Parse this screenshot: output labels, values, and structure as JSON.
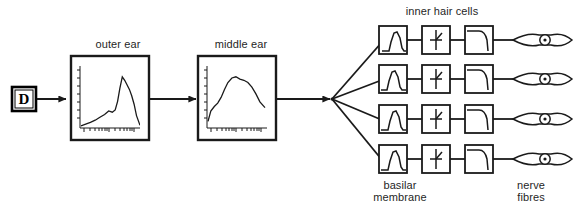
{
  "figure": {
    "background_color": "#ffffff",
    "line_color": "#1a1a1a",
    "text_color": "#1f1f1f",
    "width": 586,
    "height": 213
  },
  "source": {
    "label": "D",
    "name": "signal-source-block"
  },
  "stages": {
    "outer_ear": {
      "label": "outer ear",
      "plot": {
        "type": "line",
        "xlabel": "",
        "ylabel": "",
        "description": "outer ear transfer function, gain vs log frequency",
        "x": [
          0.0,
          0.08,
          0.16,
          0.24,
          0.32,
          0.4,
          0.47,
          0.53,
          0.58,
          0.62,
          0.66,
          0.7,
          0.74,
          0.78,
          0.82,
          0.86,
          0.9,
          0.94,
          1.0
        ],
        "y": [
          0.02,
          0.05,
          0.08,
          0.12,
          0.17,
          0.22,
          0.28,
          0.26,
          0.3,
          0.45,
          0.68,
          0.88,
          0.82,
          0.74,
          0.66,
          0.55,
          0.4,
          0.2,
          0.03
        ],
        "xlim": [
          0,
          1
        ],
        "ylim": [
          0,
          1
        ],
        "grid": false,
        "n_y_ticks": 7,
        "n_x_ticks": 16
      }
    },
    "middle_ear": {
      "label": "middle ear",
      "plot": {
        "type": "line",
        "xlabel": "",
        "ylabel": "",
        "description": "middle ear transfer function, gain vs log frequency",
        "x": [
          0.0,
          0.05,
          0.11,
          0.17,
          0.23,
          0.29,
          0.35,
          0.42,
          0.49,
          0.56,
          0.63,
          0.7,
          0.77,
          0.84,
          0.91,
          1.0
        ],
        "y": [
          0.1,
          0.28,
          0.36,
          0.42,
          0.52,
          0.66,
          0.78,
          0.86,
          0.88,
          0.84,
          0.82,
          0.78,
          0.7,
          0.58,
          0.44,
          0.34
        ],
        "xlim": [
          0,
          1
        ],
        "ylim": [
          0,
          1
        ],
        "grid": false,
        "n_y_ticks": 7,
        "n_x_ticks": 18
      }
    }
  },
  "channels": {
    "count": 4,
    "column_labels": {
      "basilar_membrane": "basilar\nmembrane",
      "basilar_membrane_line1": "basilar",
      "basilar_membrane_line2": "membrane",
      "inner_hair_cells": "inner hair cells",
      "nerve_fibres": "nerve\nfibres",
      "nerve_fibres_line1": "nerve",
      "nerve_fibres_line2": "fibres"
    },
    "blocks": [
      {
        "name": "bandpass-filter",
        "icon": "resonance-curve-icon",
        "stage": "basilar membrane"
      },
      {
        "name": "half-wave-rectifier",
        "icon": "rectifier-icon",
        "stage": "inner hair cells"
      },
      {
        "name": "lowpass-filter",
        "icon": "lowpass-curve-icon",
        "stage": "inner hair cells"
      },
      {
        "name": "nerve-fibre",
        "icon": "neuron-icon",
        "stage": "nerve fibres"
      }
    ],
    "rows": [
      {
        "index": 1,
        "bandpass_peak_position": 0.62
      },
      {
        "index": 2,
        "bandpass_peak_position": 0.5
      },
      {
        "index": 3,
        "bandpass_peak_position": 0.52
      },
      {
        "index": 4,
        "bandpass_peak_position": 0.58
      }
    ]
  },
  "connections": [
    {
      "from": "signal-source-block",
      "to": "outer-ear-block",
      "style": "arrow"
    },
    {
      "from": "outer-ear-block",
      "to": "middle-ear-block",
      "style": "arrow"
    },
    {
      "from": "middle-ear-block",
      "to": "fan-out-junction",
      "style": "arrow"
    },
    {
      "from": "fan-out-junction",
      "to": "channel-row-1",
      "style": "line"
    },
    {
      "from": "fan-out-junction",
      "to": "channel-row-2",
      "style": "line"
    },
    {
      "from": "fan-out-junction",
      "to": "channel-row-3",
      "style": "line"
    },
    {
      "from": "fan-out-junction",
      "to": "channel-row-4",
      "style": "line"
    }
  ]
}
